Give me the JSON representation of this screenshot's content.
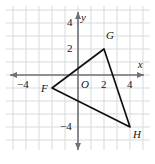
{
  "figure": {
    "type": "coordinate-plane-triangle",
    "background_color": "#ffffff",
    "grid_color": "#d7d9dc",
    "axis_color": "#6e7277",
    "shape_color": "#111111",
    "label_color": "#141414"
  },
  "axes": {
    "x_label": "x",
    "y_label": "y",
    "origin_label": "O",
    "x_range": [
      -5.0,
      5.3
    ],
    "y_range": [
      -5.3,
      5.0
    ],
    "x_ticks": [
      {
        "value": -4,
        "label": "−4"
      },
      {
        "value": 2,
        "label": "2"
      },
      {
        "value": 4,
        "label": "4"
      }
    ],
    "y_ticks": [
      {
        "value": 4,
        "label": "4"
      },
      {
        "value": 2,
        "label": "2"
      },
      {
        "value": -4,
        "label": "−4"
      }
    ],
    "grid": true,
    "grid_step": 1,
    "arrowheads": [
      "left",
      "right",
      "up",
      "down"
    ]
  },
  "chart_data": {
    "type": "scatter",
    "title": "",
    "xlabel": "x",
    "ylabel": "y",
    "xlim": [
      -5.0,
      5.3
    ],
    "ylim": [
      -5.3,
      5.0
    ],
    "grid": true,
    "series": [
      {
        "name": "Triangle FGH",
        "closed": true,
        "points": [
          {
            "label": "F",
            "x": -2,
            "y": -1,
            "label_dx": -11,
            "label_dy": 1
          },
          {
            "label": "G",
            "x": 2,
            "y": 2,
            "label_dx": 2,
            "label_dy": -13
          },
          {
            "label": "H",
            "x": 4,
            "y": -4,
            "label_dx": 3,
            "label_dy": 8
          }
        ]
      }
    ]
  }
}
